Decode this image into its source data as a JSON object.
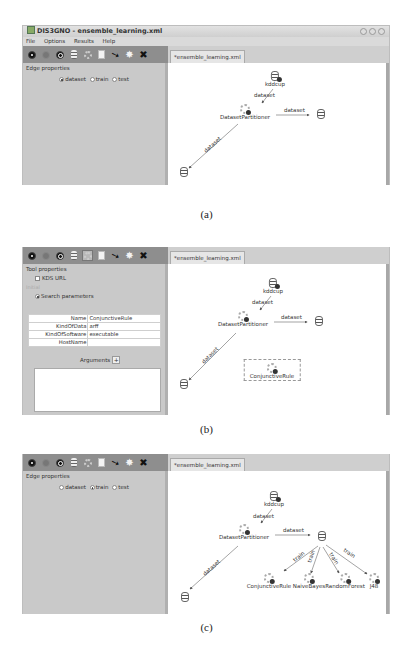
{
  "window": {
    "title": "DIS3GNO - ensemble_learning.xml",
    "menu": [
      "File",
      "Options",
      "Results",
      "Help"
    ],
    "controls": [
      "minimize",
      "maximize",
      "close"
    ]
  },
  "toolbar_icons": [
    "run-icon",
    "stop-icon",
    "refresh-icon",
    "data-icon",
    "tool-icon",
    "document-icon",
    "pointer-icon",
    "burst-icon",
    "delete-icon"
  ],
  "panels": [
    {
      "caption": "(a)",
      "tab": "*ensemble_learning.xml",
      "side": {
        "group_title": "Edge properties",
        "radio_options": [
          "dataset",
          "train",
          "test"
        ],
        "selected": "dataset"
      },
      "nodes": [
        {
          "id": "kddcup",
          "label": "kddcup",
          "type": "data"
        },
        {
          "id": "partitioner",
          "label": "DatasetPartitioner",
          "type": "tool"
        },
        {
          "id": "ds_right",
          "label": "",
          "type": "data"
        },
        {
          "id": "ds_left",
          "label": "",
          "type": "data"
        }
      ],
      "edges": [
        {
          "label": "dataset",
          "from": "kddcup",
          "to": "partitioner"
        },
        {
          "label": "dataset",
          "from": "partitioner",
          "to": "ds_right"
        },
        {
          "label": "dataset",
          "from": "partitioner",
          "to": "ds_left"
        }
      ]
    },
    {
      "caption": "(b)",
      "tab": "*ensemble_learning.xml",
      "selected_tool_icon": "tool-icon",
      "side": {
        "group_title": "Tool properties",
        "checkbox_label": "KDS URL",
        "subgroup_title": "Initial",
        "radio_label": "Search parameters",
        "properties": [
          {
            "key": "Name",
            "value": "ConjunctiveRule"
          },
          {
            "key": "KindOfData",
            "value": "arff"
          },
          {
            "key": "KindOfSoftware",
            "value": "executable"
          },
          {
            "key": "HostName",
            "value": ""
          }
        ],
        "arguments_label": "Arguments",
        "arguments_add": "+"
      },
      "nodes": [
        {
          "id": "kddcup",
          "label": "kddcup",
          "type": "data"
        },
        {
          "id": "partitioner",
          "label": "DatasetPartitioner",
          "type": "tool"
        },
        {
          "id": "ds_right",
          "label": "",
          "type": "data"
        },
        {
          "id": "ds_left",
          "label": "",
          "type": "data"
        },
        {
          "id": "conj",
          "label": "ConjunctiveRule",
          "type": "tool",
          "selected": true
        }
      ],
      "edges": [
        {
          "label": "dataset",
          "from": "kddcup",
          "to": "partitioner"
        },
        {
          "label": "dataset",
          "from": "partitioner",
          "to": "ds_right"
        },
        {
          "label": "dataset",
          "from": "partitioner",
          "to": "ds_left"
        }
      ]
    },
    {
      "caption": "(c)",
      "tab": "*ensemble_learning.xml",
      "side": {
        "group_title": "Edge properties",
        "radio_options": [
          "dataset",
          "train",
          "test"
        ],
        "selected": "train"
      },
      "nodes": [
        {
          "id": "kddcup",
          "label": "kddcup",
          "type": "data"
        },
        {
          "id": "partitioner",
          "label": "DatasetPartitioner",
          "type": "tool"
        },
        {
          "id": "ds_right",
          "label": "",
          "type": "data"
        },
        {
          "id": "ds_left",
          "label": "",
          "type": "data"
        },
        {
          "id": "conj",
          "label": "ConjunctiveRule",
          "type": "tool"
        },
        {
          "id": "nb",
          "label": "NaiveBayes",
          "type": "tool"
        },
        {
          "id": "rf",
          "label": "RandomForest",
          "type": "tool"
        },
        {
          "id": "j48",
          "label": "J48",
          "type": "tool"
        }
      ],
      "edges": [
        {
          "label": "dataset",
          "from": "kddcup",
          "to": "partitioner"
        },
        {
          "label": "dataset",
          "from": "partitioner",
          "to": "ds_right"
        },
        {
          "label": "dataset",
          "from": "partitioner",
          "to": "ds_left"
        },
        {
          "label": "train",
          "from": "ds_right",
          "to": "conj"
        },
        {
          "label": "train",
          "from": "ds_right",
          "to": "nb"
        },
        {
          "label": "train",
          "from": "ds_right",
          "to": "rf"
        },
        {
          "label": "train",
          "from": "ds_right",
          "to": "j48"
        }
      ]
    }
  ]
}
